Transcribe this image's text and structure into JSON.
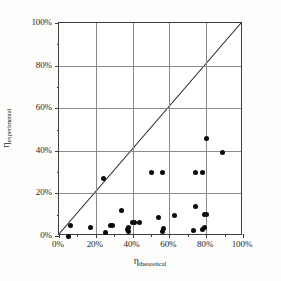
{
  "figure": {
    "background_color": "#fdfdfc",
    "plot_background_color": "#ffffff",
    "frame_color": "#3d3d3d",
    "grid_color": "#8a8a8a",
    "marker_color": "#0a0a0a",
    "line_color": "#262626"
  },
  "axes": {
    "x_symbol": "η",
    "x_subscript": "theoretical",
    "y_symbol": "η",
    "y_subscript": "experimental",
    "x_tick_labels": [
      "0%",
      "20%",
      "40%",
      "60%",
      "80%",
      "100%"
    ],
    "y_tick_labels": [
      "0%",
      "20%",
      "40%",
      "60%",
      "80%",
      "100%"
    ]
  },
  "chart_data": {
    "type": "scatter",
    "title": "",
    "xlabel": "η_theoretical",
    "ylabel": "η_experimental",
    "xlim": [
      0,
      100
    ],
    "ylim": [
      0,
      100
    ],
    "xticks": [
      0,
      20,
      40,
      60,
      80,
      100
    ],
    "yticks": [
      0,
      20,
      40,
      60,
      80,
      100
    ],
    "x_minor_ticks": [
      10,
      30,
      50,
      70,
      90
    ],
    "y_minor_ticks": [
      10,
      30,
      50,
      70,
      90
    ],
    "grid": true,
    "legend": false,
    "units": "percent",
    "reference_line": {
      "type": "identity",
      "label": "y = x",
      "from": [
        0,
        0
      ],
      "to": [
        100,
        100
      ]
    },
    "series": [
      {
        "name": "measurements",
        "marker": "filled-circle",
        "points": [
          [
            5,
            0
          ],
          [
            6,
            5
          ],
          [
            17,
            4
          ],
          [
            24,
            27
          ],
          [
            25,
            1.5
          ],
          [
            28,
            5
          ],
          [
            29,
            5
          ],
          [
            34,
            12
          ],
          [
            37,
            3
          ],
          [
            38,
            2
          ],
          [
            38,
            4
          ],
          [
            40,
            6.5
          ],
          [
            41,
            6.5
          ],
          [
            44,
            6.5
          ],
          [
            50,
            30
          ],
          [
            54,
            8.5
          ],
          [
            56,
            30
          ],
          [
            56,
            2
          ],
          [
            57,
            3.5
          ],
          [
            63,
            9.5
          ],
          [
            73,
            2.5
          ],
          [
            74,
            14
          ],
          [
            74,
            30
          ],
          [
            78,
            30
          ],
          [
            78,
            3
          ],
          [
            79,
            4
          ],
          [
            79,
            10
          ],
          [
            80,
            10
          ],
          [
            80,
            46
          ],
          [
            89,
            39
          ]
        ]
      }
    ]
  }
}
